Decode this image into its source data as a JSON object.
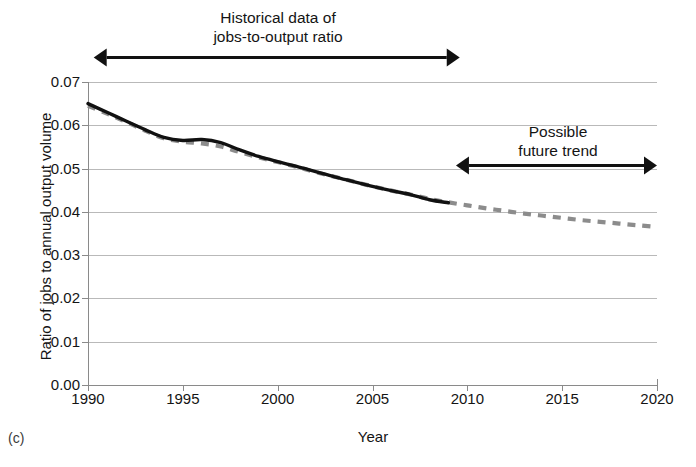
{
  "panel_label": "(c)",
  "annotations": [
    {
      "name": "historical-annotation",
      "lines": [
        "Historical data of",
        "jobs-to-output ratio"
      ],
      "text": "Historical data of\njobs-to-output ratio",
      "arrow": {
        "x_start_year": 1990.3,
        "x_end_year": 2009.6,
        "style": "double-headed"
      }
    },
    {
      "name": "future-annotation",
      "lines": [
        "Possible",
        "future trend"
      ],
      "text": "Possible\nfuture trend",
      "arrow": {
        "x_start_year": 2009.4,
        "x_end_year": 2020.0,
        "style": "double-headed"
      }
    }
  ],
  "chart_data": {
    "type": "line",
    "title": "",
    "xlabel": "Year",
    "ylabel": "Ratio of jobs to annual output volume",
    "xlim": [
      1990,
      2020
    ],
    "ylim": [
      0.0,
      0.07
    ],
    "xticks": [
      1990,
      1995,
      2000,
      2005,
      2010,
      2015,
      2020
    ],
    "xtick_labels": [
      "1990",
      "1995",
      "2000",
      "2005",
      "2010",
      "2015",
      "2020"
    ],
    "yticks": [
      0.0,
      0.01,
      0.02,
      0.03,
      0.04,
      0.05,
      0.06,
      0.07
    ],
    "ytick_labels": [
      "0.00",
      "0.01",
      "0.02",
      "0.03",
      "0.04",
      "0.05",
      "0.06",
      "0.07"
    ],
    "grid": "horizontal",
    "legend": "none",
    "colors": {
      "historical": "#111111",
      "trend": "#8c8c8c",
      "grid": "#b9b9b9",
      "axis": "#7a7a7a"
    },
    "series": [
      {
        "name": "Historical jobs-to-output ratio",
        "style": "solid",
        "color": "#111111",
        "x": [
          1990,
          1991,
          1992,
          1993,
          1994,
          1995,
          1996,
          1997,
          1998,
          1999,
          2000,
          2001,
          2002,
          2003,
          2004,
          2005,
          2006,
          2007,
          2008,
          2009
        ],
        "values": [
          0.065,
          0.063,
          0.061,
          0.059,
          0.0572,
          0.0565,
          0.0567,
          0.056,
          0.0543,
          0.0528,
          0.0516,
          0.0505,
          0.0493,
          0.0481,
          0.047,
          0.0459,
          0.0449,
          0.044,
          0.0428,
          0.0421
        ]
      },
      {
        "name": "Trend / possible future trend",
        "style": "dashed",
        "color": "#8c8c8c",
        "x": [
          1990,
          1991,
          1992,
          1993,
          1994,
          1995,
          1996,
          1997,
          1998,
          1999,
          2000,
          2001,
          2002,
          2003,
          2004,
          2005,
          2006,
          2007,
          2008,
          2009,
          2010,
          2011,
          2012,
          2013,
          2014,
          2015,
          2016,
          2017,
          2018,
          2019,
          2020
        ],
        "values": [
          0.0645,
          0.0627,
          0.0608,
          0.0588,
          0.057,
          0.0562,
          0.0558,
          0.0551,
          0.0538,
          0.0526,
          0.0515,
          0.0504,
          0.0492,
          0.0481,
          0.047,
          0.0459,
          0.0449,
          0.044,
          0.043,
          0.0422,
          0.0415,
          0.0408,
          0.0402,
          0.0396,
          0.0391,
          0.0386,
          0.0381,
          0.0377,
          0.0373,
          0.0369,
          0.0365
        ]
      }
    ]
  }
}
